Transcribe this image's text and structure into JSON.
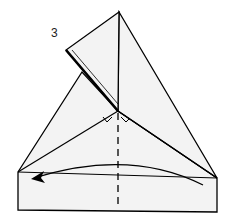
{
  "diagram": {
    "type": "origami-fold-instruction",
    "step_number": "3",
    "colors": {
      "paper": "#f3f3f3",
      "line": "#000000",
      "background": "#ffffff"
    },
    "elements": [
      "paper-shape",
      "folded-flap",
      "valley-fold-dashed-line",
      "fold-direction-arrow",
      "right-angle-markers"
    ]
  }
}
